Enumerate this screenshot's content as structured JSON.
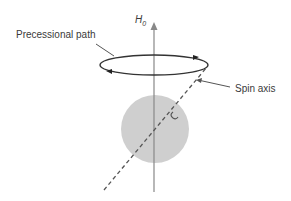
{
  "diagram": {
    "field_label": "H",
    "field_subscript": "0",
    "precession_label": "Precessional path",
    "spin_axis_label": "Spin axis",
    "colors": {
      "line": "#444444",
      "axis": "#888888",
      "sphere": "#cfcfcf",
      "text": "#3a3a3a"
    }
  }
}
